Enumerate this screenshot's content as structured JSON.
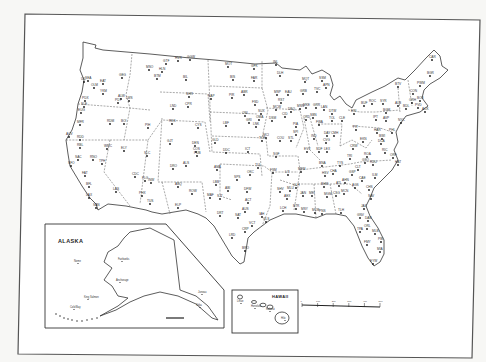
{
  "map": {
    "title": "Contiguous United States station locations",
    "insets": {
      "alaska": {
        "title": "ALASKA",
        "cities": [
          {
            "name": "Nome",
            "x": 78,
            "y": 262
          },
          {
            "name": "Fairbanks",
            "x": 122,
            "y": 260
          },
          {
            "name": "Anchorage",
            "x": 120,
            "y": 281
          },
          {
            "name": "King Salmon",
            "x": 88,
            "y": 298
          },
          {
            "name": "Cold Bay",
            "x": 74,
            "y": 308
          },
          {
            "name": "Juneau",
            "x": 202,
            "y": 293
          },
          {
            "name": "Sitka",
            "x": 200,
            "y": 306
          }
        ],
        "scale_labels": [
          "0",
          "100",
          "200"
        ]
      },
      "hawaii": {
        "title": "HAWAII",
        "cities": [
          {
            "name": "Lihue",
            "x": 241,
            "y": 302
          },
          {
            "name": "Honolulu",
            "x": 255,
            "y": 307
          },
          {
            "name": "Kahului",
            "x": 270,
            "y": 310
          },
          {
            "name": "Hilo",
            "x": 285,
            "y": 319
          }
        ],
        "scale_labels": [
          "0",
          "50",
          "100"
        ]
      }
    },
    "scale": {
      "labels": [
        "0",
        "100",
        "200",
        "300",
        "400",
        "500"
      ],
      "unit": "miles"
    },
    "stations": [
      {
        "id": "SEA",
        "x": 88,
        "y": 81
      },
      {
        "id": "UIL",
        "x": 84,
        "y": 82
      },
      {
        "id": "OLM",
        "x": 94,
        "y": 88
      },
      {
        "id": "GEG",
        "x": 122,
        "y": 78
      },
      {
        "id": "EAT",
        "x": 103,
        "y": 84
      },
      {
        "id": "YKM",
        "x": 103,
        "y": 94
      },
      {
        "id": "PDX",
        "x": 85,
        "y": 101
      },
      {
        "id": "SLE",
        "x": 84,
        "y": 107
      },
      {
        "id": "EUG",
        "x": 81,
        "y": 113
      },
      {
        "id": "PDT",
        "x": 118,
        "y": 103
      },
      {
        "id": "ALW",
        "x": 121,
        "y": 99
      },
      {
        "id": "LWS",
        "x": 129,
        "y": 101
      },
      {
        "id": "MFR",
        "x": 80,
        "y": 125
      },
      {
        "id": "RDM",
        "x": 110,
        "y": 124
      },
      {
        "id": "BOI",
        "x": 124,
        "y": 124
      },
      {
        "id": "PIH",
        "x": 148,
        "y": 128
      },
      {
        "id": "ACV",
        "x": 69,
        "y": 137
      },
      {
        "id": "RDD",
        "x": 80,
        "y": 140
      },
      {
        "id": "RBL",
        "x": 80,
        "y": 148
      },
      {
        "id": "SAC",
        "x": 78,
        "y": 160
      },
      {
        "id": "SFO",
        "x": 71,
        "y": 166
      },
      {
        "id": "FAT",
        "x": 85,
        "y": 176
      },
      {
        "id": "BFL",
        "x": 89,
        "y": 187
      },
      {
        "id": "LAX",
        "x": 89,
        "y": 198
      },
      {
        "id": "SAN",
        "x": 96,
        "y": 208
      },
      {
        "id": "RNO",
        "x": 93,
        "y": 160
      },
      {
        "id": "WMC",
        "x": 107,
        "y": 149
      },
      {
        "id": "ELY",
        "x": 124,
        "y": 151
      },
      {
        "id": "TPH",
        "x": 102,
        "y": 164
      },
      {
        "id": "LAS",
        "x": 116,
        "y": 192
      },
      {
        "id": "SLC",
        "x": 147,
        "y": 156
      },
      {
        "id": "CDC",
        "x": 135,
        "y": 177
      },
      {
        "id": "HLN",
        "x": 162,
        "y": 72
      },
      {
        "id": "GTF",
        "x": 166,
        "y": 64
      },
      {
        "id": "MSO",
        "x": 149,
        "y": 70
      },
      {
        "id": "BIL",
        "x": 186,
        "y": 80
      },
      {
        "id": "GGW",
        "x": 190,
        "y": 60
      },
      {
        "id": "HVR",
        "x": 178,
        "y": 61
      },
      {
        "id": "BTM",
        "x": 157,
        "y": 79
      },
      {
        "id": "CPR",
        "x": 188,
        "y": 107
      },
      {
        "id": "LND",
        "x": 173,
        "y": 109
      },
      {
        "id": "SHR",
        "x": 189,
        "y": 97
      },
      {
        "id": "RKS",
        "x": 172,
        "y": 124
      },
      {
        "id": "CYS",
        "x": 198,
        "y": 128
      },
      {
        "id": "DEN",
        "x": 195,
        "y": 146
      },
      {
        "id": "COS",
        "x": 196,
        "y": 152
      },
      {
        "id": "PUB",
        "x": 197,
        "y": 156
      },
      {
        "id": "GJT",
        "x": 170,
        "y": 144
      },
      {
        "id": "ALS",
        "x": 186,
        "y": 166
      },
      {
        "id": "DRO",
        "x": 173,
        "y": 169
      },
      {
        "id": "PHX",
        "x": 142,
        "y": 196
      },
      {
        "id": "FLG",
        "x": 145,
        "y": 181
      },
      {
        "id": "TUS",
        "x": 150,
        "y": 204
      },
      {
        "id": "INW",
        "x": 151,
        "y": 183
      },
      {
        "id": "ABQ",
        "x": 178,
        "y": 187
      },
      {
        "id": "ROW",
        "x": 192,
        "y": 194
      },
      {
        "id": "ELP",
        "x": 178,
        "y": 208
      },
      {
        "id": "BIS",
        "x": 233,
        "y": 80
      },
      {
        "id": "MOT",
        "x": 228,
        "y": 67
      },
      {
        "id": "FAR",
        "x": 254,
        "y": 81
      },
      {
        "id": "GFK",
        "x": 254,
        "y": 69
      },
      {
        "id": "RAP",
        "x": 211,
        "y": 99
      },
      {
        "id": "PIR",
        "x": 232,
        "y": 98
      },
      {
        "id": "ABR",
        "x": 244,
        "y": 95
      },
      {
        "id": "FSD",
        "x": 255,
        "y": 105
      },
      {
        "id": "ONL",
        "x": 245,
        "y": 116
      },
      {
        "id": "LBF",
        "x": 226,
        "y": 126
      },
      {
        "id": "GRI",
        "x": 249,
        "y": 123
      },
      {
        "id": "OMA",
        "x": 259,
        "y": 120
      },
      {
        "id": "LNK",
        "x": 256,
        "y": 127
      },
      {
        "id": "GLD",
        "x": 215,
        "y": 143
      },
      {
        "id": "DDC",
        "x": 226,
        "y": 153
      },
      {
        "id": "ICT",
        "x": 248,
        "y": 152
      },
      {
        "id": "TOP",
        "x": 262,
        "y": 141
      },
      {
        "id": "OKC",
        "x": 250,
        "y": 175
      },
      {
        "id": "TUL",
        "x": 258,
        "y": 168
      },
      {
        "id": "AMA",
        "x": 217,
        "y": 170
      },
      {
        "id": "LBB",
        "x": 216,
        "y": 185
      },
      {
        "id": "MAF",
        "x": 210,
        "y": 198
      },
      {
        "id": "SJT",
        "x": 220,
        "y": 199
      },
      {
        "id": "ABI",
        "x": 228,
        "y": 191
      },
      {
        "id": "DFW",
        "x": 247,
        "y": 192
      },
      {
        "id": "SPS",
        "x": 237,
        "y": 180
      },
      {
        "id": "ACT",
        "x": 248,
        "y": 203
      },
      {
        "id": "AUS",
        "x": 245,
        "y": 212
      },
      {
        "id": "SAT",
        "x": 238,
        "y": 218
      },
      {
        "id": "DRT",
        "x": 220,
        "y": 216
      },
      {
        "id": "IAH",
        "x": 262,
        "y": 217
      },
      {
        "id": "GLS",
        "x": 266,
        "y": 222
      },
      {
        "id": "VCT",
        "x": 252,
        "y": 226
      },
      {
        "id": "CRP",
        "x": 245,
        "y": 232
      },
      {
        "id": "BRO",
        "x": 245,
        "y": 251
      },
      {
        "id": "LRD",
        "x": 232,
        "y": 238
      },
      {
        "id": "MSP",
        "x": 277,
        "y": 95
      },
      {
        "id": "DLH",
        "x": 280,
        "y": 76
      },
      {
        "id": "INL",
        "x": 276,
        "y": 65
      },
      {
        "id": "RST",
        "x": 281,
        "y": 103
      },
      {
        "id": "EAU",
        "x": 288,
        "y": 95
      },
      {
        "id": "MSN",
        "x": 300,
        "y": 109
      },
      {
        "id": "GRB",
        "x": 303,
        "y": 94
      },
      {
        "id": "MKE",
        "x": 306,
        "y": 108
      },
      {
        "id": "DSM",
        "x": 272,
        "y": 121
      },
      {
        "id": "DBQ",
        "x": 291,
        "y": 112
      },
      {
        "id": "CID",
        "x": 285,
        "y": 117
      },
      {
        "id": "MCW",
        "x": 276,
        "y": 110
      },
      {
        "id": "SUX",
        "x": 261,
        "y": 114
      },
      {
        "id": "MCI",
        "x": 266,
        "y": 138
      },
      {
        "id": "STL",
        "x": 291,
        "y": 141
      },
      {
        "id": "COU",
        "x": 280,
        "y": 141
      },
      {
        "id": "SGF",
        "x": 276,
        "y": 157
      },
      {
        "id": "ORD",
        "x": 306,
        "y": 120
      },
      {
        "id": "PIA",
        "x": 296,
        "y": 127
      },
      {
        "id": "SPI",
        "x": 296,
        "y": 135
      },
      {
        "id": "IND",
        "x": 314,
        "y": 139
      },
      {
        "id": "EVV",
        "x": 307,
        "y": 152
      },
      {
        "id": "SDF",
        "x": 319,
        "y": 152
      },
      {
        "id": "LEX",
        "x": 327,
        "y": 152
      },
      {
        "id": "FWA",
        "x": 319,
        "y": 125
      },
      {
        "id": "SBN",
        "x": 313,
        "y": 118
      },
      {
        "id": "DTW",
        "x": 332,
        "y": 114
      },
      {
        "id": "LAN",
        "x": 324,
        "y": 110
      },
      {
        "id": "GRR",
        "x": 316,
        "y": 108
      },
      {
        "id": "APN",
        "x": 326,
        "y": 88
      },
      {
        "id": "TVC",
        "x": 317,
        "y": 92
      },
      {
        "id": "MQT",
        "x": 305,
        "y": 82
      },
      {
        "id": "SSM",
        "x": 322,
        "y": 81
      },
      {
        "id": "CLE",
        "x": 342,
        "y": 121
      },
      {
        "id": "CMH",
        "x": 334,
        "y": 136
      },
      {
        "id": "CVG",
        "x": 326,
        "y": 143
      },
      {
        "id": "DAY",
        "x": 327,
        "y": 136
      },
      {
        "id": "TOL",
        "x": 332,
        "y": 121
      },
      {
        "id": "PIT",
        "x": 356,
        "y": 130
      },
      {
        "id": "ERI",
        "x": 354,
        "y": 114
      },
      {
        "id": "BUF",
        "x": 364,
        "y": 106
      },
      {
        "id": "ROC",
        "x": 372,
        "y": 104
      },
      {
        "id": "SYR",
        "x": 383,
        "y": 104
      },
      {
        "id": "ALB",
        "x": 398,
        "y": 106
      },
      {
        "id": "BGM",
        "x": 386,
        "y": 113
      },
      {
        "id": "IPT",
        "x": 376,
        "y": 120
      },
      {
        "id": "AVP",
        "x": 386,
        "y": 121
      },
      {
        "id": "HAR",
        "x": 377,
        "y": 133
      },
      {
        "id": "PHL",
        "x": 392,
        "y": 133
      },
      {
        "id": "NYC",
        "x": 401,
        "y": 123
      },
      {
        "id": "BDL",
        "x": 406,
        "y": 109
      },
      {
        "id": "PVD",
        "x": 418,
        "y": 108
      },
      {
        "id": "BOS",
        "x": 420,
        "y": 101
      },
      {
        "id": "ACK",
        "x": 425,
        "y": 112
      },
      {
        "id": "ORH",
        "x": 412,
        "y": 103
      },
      {
        "id": "CON",
        "x": 413,
        "y": 94
      },
      {
        "id": "BTV",
        "x": 398,
        "y": 87
      },
      {
        "id": "PWM",
        "x": 420,
        "y": 86
      },
      {
        "id": "BGR",
        "x": 430,
        "y": 76
      },
      {
        "id": "CAR",
        "x": 432,
        "y": 60
      },
      {
        "id": "BWI",
        "x": 382,
        "y": 139
      },
      {
        "id": "DCA",
        "x": 381,
        "y": 144
      },
      {
        "id": "ORF",
        "x": 393,
        "y": 158
      },
      {
        "id": "RIC",
        "x": 385,
        "y": 153
      },
      {
        "id": "ROA",
        "x": 367,
        "y": 157
      },
      {
        "id": "CRW",
        "x": 353,
        "y": 149
      },
      {
        "id": "EKN",
        "x": 363,
        "y": 142
      },
      {
        "id": "BNA",
        "x": 322,
        "y": 166
      },
      {
        "id": "MEM",
        "x": 301,
        "y": 172
      },
      {
        "id": "TYS",
        "x": 340,
        "y": 166
      },
      {
        "id": "CHA",
        "x": 333,
        "y": 174
      },
      {
        "id": "TRI",
        "x": 350,
        "y": 159
      },
      {
        "id": "RDU",
        "x": 373,
        "y": 165
      },
      {
        "id": "GSO",
        "x": 365,
        "y": 163
      },
      {
        "id": "CLT",
        "x": 358,
        "y": 170
      },
      {
        "id": "ILM",
        "x": 375,
        "y": 178
      },
      {
        "id": "HAT",
        "x": 398,
        "y": 165
      },
      {
        "id": "CAE",
        "x": 362,
        "y": 181
      },
      {
        "id": "CHS",
        "x": 369,
        "y": 190
      },
      {
        "id": "GSP",
        "x": 352,
        "y": 175
      },
      {
        "id": "ATL",
        "x": 339,
        "y": 186
      },
      {
        "id": "AHN",
        "x": 345,
        "y": 183
      },
      {
        "id": "MCN",
        "x": 344,
        "y": 194
      },
      {
        "id": "CSG",
        "x": 336,
        "y": 196
      },
      {
        "id": "SAV",
        "x": 371,
        "y": 199
      },
      {
        "id": "AGS",
        "x": 355,
        "y": 188
      },
      {
        "id": "BHM",
        "x": 324,
        "y": 187
      },
      {
        "id": "HSV",
        "x": 325,
        "y": 176
      },
      {
        "id": "MGM",
        "x": 327,
        "y": 197
      },
      {
        "id": "MOB",
        "x": 315,
        "y": 213
      },
      {
        "id": "JAN",
        "x": 303,
        "y": 196
      },
      {
        "id": "MEI",
        "x": 312,
        "y": 196
      },
      {
        "id": "GLH",
        "x": 296,
        "y": 188
      },
      {
        "id": "LIT",
        "x": 288,
        "y": 175
      },
      {
        "id": "FSM",
        "x": 273,
        "y": 173
      },
      {
        "id": "SHV",
        "x": 280,
        "y": 192
      },
      {
        "id": "MLU",
        "x": 290,
        "y": 191
      },
      {
        "id": "LCH",
        "x": 283,
        "y": 211
      },
      {
        "id": "BTR",
        "x": 296,
        "y": 209
      },
      {
        "id": "MSY",
        "x": 304,
        "y": 212
      },
      {
        "id": "AEX",
        "x": 287,
        "y": 199
      },
      {
        "id": "TLH",
        "x": 341,
        "y": 213
      },
      {
        "id": "PNS",
        "x": 322,
        "y": 214
      },
      {
        "id": "JAX",
        "x": 364,
        "y": 209
      },
      {
        "id": "GNV",
        "x": 360,
        "y": 218
      },
      {
        "id": "DAB",
        "x": 368,
        "y": 221
      },
      {
        "id": "ORL",
        "x": 367,
        "y": 229
      },
      {
        "id": "TPA",
        "x": 360,
        "y": 232
      },
      {
        "id": "MLB",
        "x": 375,
        "y": 234
      },
      {
        "id": "PBI",
        "x": 381,
        "y": 242
      },
      {
        "id": "MIA",
        "x": 380,
        "y": 252
      },
      {
        "id": "EYW",
        "x": 373,
        "y": 264
      },
      {
        "id": "FMY",
        "x": 367,
        "y": 245
      }
    ]
  }
}
